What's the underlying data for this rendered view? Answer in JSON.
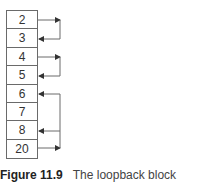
{
  "figure": {
    "cells": [
      "2",
      "3",
      "4",
      "5",
      "6",
      "7",
      "8",
      "20"
    ],
    "links": [
      {
        "from": 0,
        "to": 1
      },
      {
        "from": 2,
        "to": 3
      },
      {
        "from": 7,
        "to": 4
      },
      {
        "from": 7,
        "to": 6
      }
    ],
    "caption": {
      "label": "Figure 11.9",
      "text": "The loopback block"
    },
    "line_color": "#6a6a6a"
  }
}
